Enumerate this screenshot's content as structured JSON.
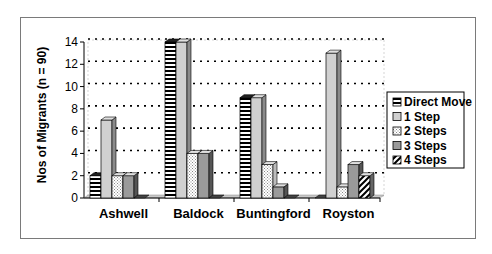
{
  "chart_data": {
    "type": "bar",
    "title": "",
    "xlabel": "",
    "ylabel": "Nos of  Migrants (n = 90)",
    "ylim": [
      0,
      14
    ],
    "yticks": [
      0,
      2,
      4,
      6,
      8,
      10,
      12,
      14
    ],
    "grid": "dotted horizontal",
    "legend_position": "right",
    "categories": [
      "Ashwell",
      "Baldock",
      "Buntingford",
      "Royston"
    ],
    "series": [
      {
        "name": "Direct Move",
        "pattern": "horizontal-stripes",
        "values": [
          2,
          14,
          9,
          0
        ]
      },
      {
        "name": "1 Step",
        "pattern": "solid-light-grey",
        "values": [
          7,
          14,
          9,
          13
        ]
      },
      {
        "name": "2 Steps",
        "pattern": "dotted",
        "values": [
          2,
          4,
          3,
          1
        ]
      },
      {
        "name": "3 Steps",
        "pattern": "solid-mid-grey",
        "values": [
          2,
          4,
          1,
          3
        ]
      },
      {
        "name": "4 Steps",
        "pattern": "diagonal-stripes",
        "values": [
          0,
          0,
          0,
          2
        ]
      }
    ]
  },
  "labels": {
    "ylabel": "Nos of  Migrants (n = 90)",
    "ticks": [
      "0",
      "2",
      "4",
      "6",
      "8",
      "10",
      "12",
      "14"
    ],
    "categories": [
      "Ashwell",
      "Baldock",
      "Buntingford",
      "Royston"
    ],
    "legend": [
      "Direct Move",
      "1 Step",
      "2 Steps",
      "3 Steps",
      "4 Steps"
    ]
  }
}
